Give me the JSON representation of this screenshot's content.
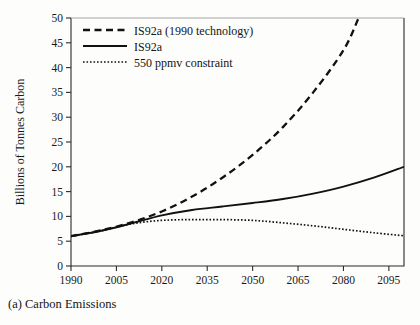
{
  "caption": "(a) Carbon Emissions",
  "chart_data": {
    "type": "line",
    "title": "",
    "xlabel": "",
    "ylabel": "Billions of Tonnes Carbon",
    "xlim": [
      1990,
      2100
    ],
    "ylim": [
      0,
      50
    ],
    "xticks": [
      1990,
      2005,
      2020,
      2035,
      2050,
      2065,
      2080,
      2095
    ],
    "yticks": [
      0,
      5,
      10,
      15,
      20,
      25,
      30,
      35,
      40,
      45,
      50
    ],
    "grid": false,
    "legend_position": "top-left",
    "series": [
      {
        "name": "IS92a (1990 technology)",
        "style": "dashed",
        "x": [
          1990,
          2000,
          2010,
          2020,
          2030,
          2040,
          2050,
          2060,
          2070,
          2080,
          2085
        ],
        "values": [
          6.0,
          7.2,
          8.8,
          11.0,
          14.0,
          17.8,
          22.4,
          28.0,
          35.0,
          43.5,
          50.0
        ]
      },
      {
        "name": "IS92a",
        "style": "solid",
        "x": [
          1990,
          2000,
          2010,
          2020,
          2030,
          2040,
          2050,
          2060,
          2070,
          2080,
          2090,
          2100
        ],
        "values": [
          6.0,
          7.1,
          8.6,
          10.2,
          11.3,
          12.0,
          12.7,
          13.5,
          14.6,
          16.0,
          17.8,
          20.0
        ]
      },
      {
        "name": "550 ppmv constraint",
        "style": "dotted",
        "x": [
          1990,
          2000,
          2010,
          2020,
          2030,
          2040,
          2050,
          2060,
          2070,
          2080,
          2090,
          2100
        ],
        "values": [
          6.0,
          7.1,
          8.5,
          9.2,
          9.35,
          9.35,
          9.2,
          8.7,
          8.1,
          7.4,
          6.7,
          6.1
        ]
      }
    ]
  },
  "legend": {
    "items": [
      {
        "label": "IS92a (1990 technology)",
        "style": "dashed"
      },
      {
        "label": "IS92a",
        "style": "solid"
      },
      {
        "label": "550 ppmv constraint",
        "style": "dotted"
      }
    ]
  }
}
